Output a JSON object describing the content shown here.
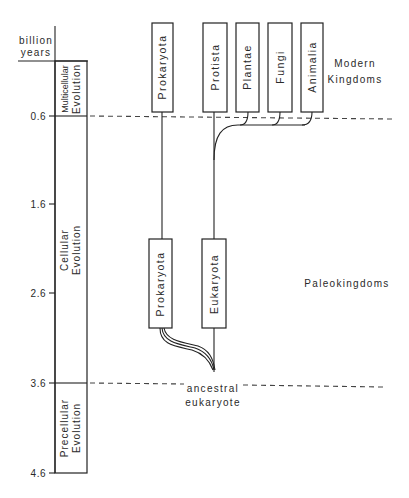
{
  "axis": {
    "unit_line1": "billion",
    "unit_line2": "years",
    "ticks": [
      {
        "label": "0.6",
        "value": 0.6
      },
      {
        "label": "1.6",
        "value": 1.6
      },
      {
        "label": "2.6",
        "value": 2.6
      },
      {
        "label": "3.6",
        "value": 3.6
      },
      {
        "label": "4.6",
        "value": 4.6
      }
    ]
  },
  "eras": [
    {
      "line1": "Multicellular",
      "line2": "Evolution",
      "from": 0.0,
      "to": 0.6
    },
    {
      "line1": "Cellular",
      "line2": "Evolution",
      "from": 0.6,
      "to": 3.6
    },
    {
      "line1": "Precellular",
      "line2": "Evolution",
      "from": 3.6,
      "to": 4.6
    }
  ],
  "modern_kingdoms": {
    "label_line1": "Modern",
    "label_line2": "Kingdoms",
    "boxes": [
      "Prokaryota",
      "Protista",
      "Plantae",
      "Fungi",
      "Animalia"
    ]
  },
  "paleokingdoms": {
    "label": "Paleokingdoms",
    "boxes": [
      "Prokaryota",
      "Eukaryota"
    ]
  },
  "origin": {
    "line1": "ancestral",
    "line2": "eukaryote"
  }
}
